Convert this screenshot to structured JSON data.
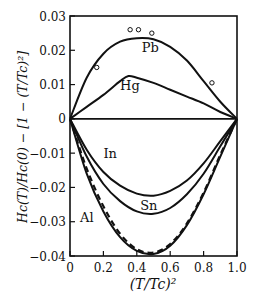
{
  "chart_data": {
    "type": "line",
    "title": "",
    "xlabel": "(T/Tc)²",
    "ylabel": "Hc(T)/Hc(0) − [1 − (T/Tc)²]",
    "xlim": [
      0,
      1.0
    ],
    "ylim": [
      -0.04,
      0.03
    ],
    "xticks": [
      0,
      0.2,
      0.4,
      0.6,
      0.8,
      1.0
    ],
    "xtick_labels": [
      "0",
      "0.2",
      "0.4",
      "0.6",
      "0.8",
      "1.0"
    ],
    "yticks": [
      0.03,
      0.02,
      0.01,
      0,
      -0.01,
      -0.02,
      -0.03,
      -0.04
    ],
    "ytick_labels": [
      "0.03",
      "0.02",
      "0.01",
      "0",
      "−0.01",
      "−0.02",
      "−0.03",
      "−0.04"
    ],
    "grid": false,
    "series": [
      {
        "name": "Pb",
        "style": "solid",
        "x": [
          0,
          0.1,
          0.2,
          0.3,
          0.4,
          0.5,
          0.6,
          0.7,
          0.8,
          0.9,
          1.0
        ],
        "y": [
          0,
          0.012,
          0.019,
          0.0225,
          0.0235,
          0.0232,
          0.021,
          0.017,
          0.011,
          0.005,
          0
        ],
        "label_pos": [
          0.43,
          0.0195
        ]
      },
      {
        "name": "Pb (measured)",
        "style": "markers",
        "marker": "open-circle",
        "x": [
          0.16,
          0.36,
          0.41,
          0.49,
          0.85
        ],
        "y": [
          0.015,
          0.026,
          0.026,
          0.025,
          0.0105
        ]
      },
      {
        "name": "Hg",
        "style": "solid",
        "x": [
          0,
          0.1,
          0.2,
          0.3,
          0.35,
          0.4,
          0.5,
          0.6,
          0.7,
          0.8,
          0.9,
          1.0
        ],
        "y": [
          0,
          0.0035,
          0.007,
          0.011,
          0.0125,
          0.012,
          0.0105,
          0.0085,
          0.0065,
          0.0045,
          0.002,
          0
        ],
        "label_pos": [
          0.3,
          0.0085
        ]
      },
      {
        "name": "In",
        "style": "solid",
        "x": [
          0,
          0.1,
          0.2,
          0.3,
          0.4,
          0.5,
          0.6,
          0.7,
          0.8,
          0.9,
          1.0
        ],
        "y": [
          0,
          -0.009,
          -0.0155,
          -0.0195,
          -0.0218,
          -0.0224,
          -0.021,
          -0.018,
          -0.013,
          -0.0065,
          0
        ],
        "label_pos": [
          0.2,
          -0.0115
        ]
      },
      {
        "name": "Sn",
        "style": "solid",
        "x": [
          0,
          0.1,
          0.2,
          0.3,
          0.4,
          0.5,
          0.6,
          0.7,
          0.8,
          0.9,
          1.0
        ],
        "y": [
          0,
          -0.011,
          -0.019,
          -0.024,
          -0.027,
          -0.0277,
          -0.026,
          -0.022,
          -0.016,
          -0.008,
          0
        ],
        "label_pos": [
          0.42,
          -0.0265
        ]
      },
      {
        "name": "Al",
        "style": "solid",
        "x": [
          0,
          0.1,
          0.2,
          0.3,
          0.4,
          0.5,
          0.6,
          0.7,
          0.8,
          0.9,
          1.0
        ],
        "y": [
          0,
          -0.016,
          -0.027,
          -0.0345,
          -0.0385,
          -0.0394,
          -0.037,
          -0.031,
          -0.022,
          -0.011,
          0
        ],
        "label_pos": [
          0.06,
          -0.03
        ]
      },
      {
        "name": "theory (dashed)",
        "style": "dashed",
        "x": [
          0,
          0.1,
          0.2,
          0.3,
          0.4,
          0.5,
          0.6,
          0.7,
          0.8,
          0.9,
          1.0
        ],
        "y": [
          0,
          -0.0145,
          -0.0255,
          -0.0335,
          -0.038,
          -0.039,
          -0.0365,
          -0.0305,
          -0.0215,
          -0.0105,
          0
        ]
      }
    ]
  }
}
